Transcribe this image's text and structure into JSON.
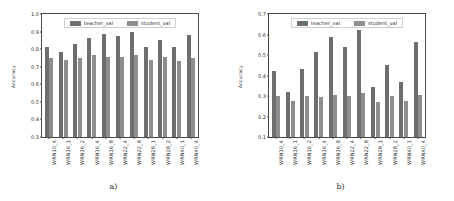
{
  "figure": {
    "background": "#ffffff",
    "teacher_color": "#6e6e6e",
    "student_color": "#8e8e8e"
  },
  "panels": [
    {
      "caption": "a)",
      "ylabel": "Accuracy",
      "yticks": [
        "0.3",
        "0.4",
        "0.5",
        "0.6",
        "0.7",
        "0.8",
        "0.9",
        "1.0"
      ],
      "legend": [
        {
          "label": "teacher_val",
          "color": "#6e6e6e"
        },
        {
          "label": "student_val",
          "color": "#8e8e8e"
        }
      ]
    },
    {
      "caption": "b)",
      "ylabel": "Accuracy",
      "yticks": [
        "0.1",
        "0.2",
        "0.3",
        "0.4",
        "0.5",
        "0.6",
        "0.7"
      ],
      "legend": [
        {
          "label": "teacher_val",
          "color": "#6e6e6e"
        },
        {
          "label": "student_val",
          "color": "#8e8e8e"
        }
      ]
    }
  ],
  "chart_data": [
    {
      "type": "bar",
      "title": "a)",
      "xlabel": "",
      "ylabel": "Accuracy",
      "ylim": [
        0.3,
        1.0
      ],
      "yticks": [
        0.3,
        0.4,
        0.5,
        0.6,
        0.7,
        0.8,
        0.9,
        1.0
      ],
      "grid": false,
      "legend_position": "upper center",
      "categories": [
        "WRN10_4",
        "WRN16_1",
        "WRN16_2",
        "WRN16_4",
        "WRN16_8",
        "WRN22_4",
        "WRN22_8",
        "WRN28_1",
        "WRN28_2",
        "WRN40_1",
        "WRN40_4"
      ],
      "series": [
        {
          "name": "teacher_val",
          "color": "#6e6e6e",
          "values": [
            0.81,
            0.785,
            0.83,
            0.865,
            0.885,
            0.875,
            0.895,
            0.81,
            0.85,
            0.813,
            0.88
          ]
        },
        {
          "name": "student_val",
          "color": "#8e8e8e",
          "values": [
            0.752,
            0.737,
            0.748,
            0.766,
            0.757,
            0.757,
            0.765,
            0.741,
            0.758,
            0.731,
            0.752
          ]
        }
      ]
    },
    {
      "type": "bar",
      "title": "b)",
      "xlabel": "",
      "ylabel": "Accuracy",
      "ylim": [
        0.1,
        0.7
      ],
      "yticks": [
        0.1,
        0.2,
        0.3,
        0.4,
        0.5,
        0.6,
        0.7
      ],
      "grid": false,
      "legend_position": "upper center",
      "categories": [
        "WRN10_4",
        "WRN16_1",
        "WRN16_2",
        "WRN16_4",
        "WRN16_8",
        "WRN22_4",
        "WRN22_8",
        "WRN28_1",
        "WRN28_2",
        "WRN40_1",
        "WRN40_4"
      ],
      "series": [
        {
          "name": "teacher_val",
          "color": "#6e6e6e",
          "values": [
            0.42,
            0.32,
            0.43,
            0.513,
            0.59,
            0.54,
            0.623,
            0.342,
            0.45,
            0.367,
            0.562
          ]
        },
        {
          "name": "student_val",
          "color": "#8e8e8e",
          "values": [
            0.3,
            0.277,
            0.302,
            0.297,
            0.305,
            0.3,
            0.317,
            0.27,
            0.3,
            0.277,
            0.304
          ]
        }
      ]
    }
  ]
}
